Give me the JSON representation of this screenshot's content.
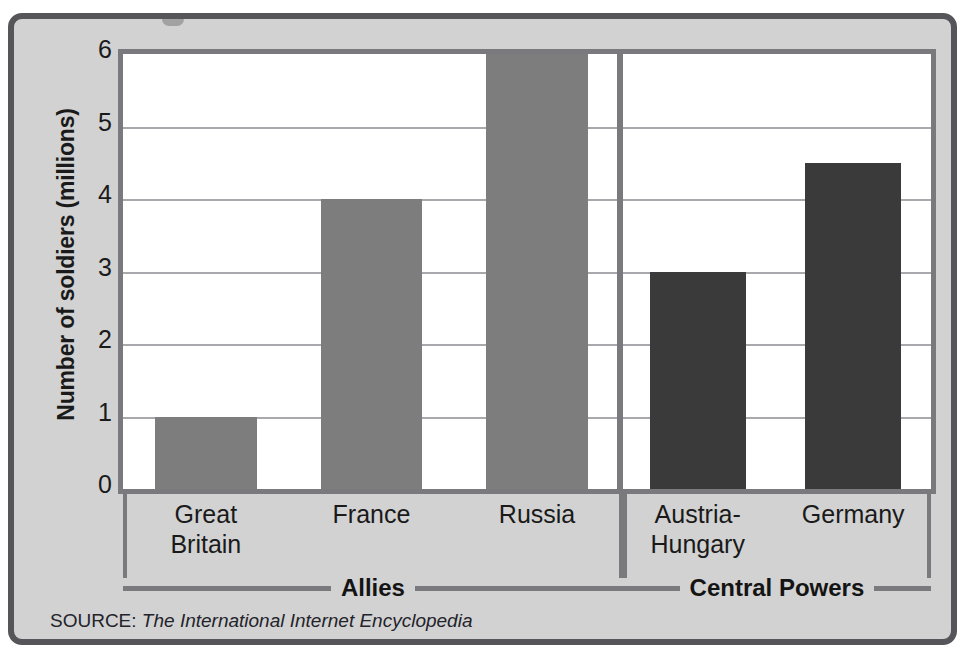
{
  "figure": {
    "source_prefix": "SOURCE:",
    "source_title": "The International Internet Encyclopedia",
    "colors": {
      "panel_background": "#d2d2d2",
      "panel_border": "#56565a",
      "plot_background": "#ffffff",
      "plot_border": "#7a7a7e",
      "gridline": "#a9a9ad",
      "allies_bar": "#7d7d7d",
      "central_powers_bar": "#3a3a3a",
      "text": "#1a1a1a"
    }
  },
  "chart_data": {
    "type": "bar",
    "title": "",
    "xlabel": "",
    "ylabel": "Number of soldiers (millions)",
    "ylim": [
      0,
      6
    ],
    "yticks": [
      6,
      5,
      4,
      3,
      2,
      1,
      0
    ],
    "ytick_labels": [
      "6",
      "5",
      "4",
      "3",
      "2",
      "1",
      "0"
    ],
    "grid": true,
    "legend": "none",
    "categories": [
      "Great Britain",
      "France",
      "Russia",
      "Austria-Hungary",
      "Germany"
    ],
    "values": [
      1,
      4,
      6,
      3,
      4.5
    ],
    "bars": [
      {
        "label": "Great Britain",
        "label_lines": [
          "Great",
          "Britain"
        ],
        "value": 1,
        "group": "Allies",
        "color": "#7d7d7d"
      },
      {
        "label": "France",
        "label_lines": [
          "France"
        ],
        "value": 4,
        "group": "Allies",
        "color": "#7d7d7d"
      },
      {
        "label": "Russia",
        "label_lines": [
          "Russia"
        ],
        "value": 6,
        "group": "Allies",
        "color": "#7d7d7d"
      },
      {
        "label": "Austria-Hungary",
        "label_lines": [
          "Austria-",
          "Hungary"
        ],
        "value": 3,
        "group": "Central Powers",
        "color": "#3a3a3a"
      },
      {
        "label": "Germany",
        "label_lines": [
          "Germany"
        ],
        "value": 4.5,
        "group": "Central Powers",
        "color": "#3a3a3a"
      }
    ],
    "groups": [
      {
        "name": "Allies",
        "categories": [
          "Great Britain",
          "France",
          "Russia"
        ]
      },
      {
        "name": "Central Powers",
        "categories": [
          "Austria-Hungary",
          "Germany"
        ]
      }
    ]
  }
}
